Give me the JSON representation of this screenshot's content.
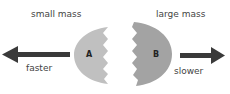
{
  "labels": {
    "small_mass": "small mass",
    "large_mass": "large mass",
    "faster": "faster",
    "slower": "slower",
    "piece_a": "A",
    "piece_b": "B"
  },
  "colors": {
    "piece_a": "#c0c0c0",
    "piece_b": "#a3a3a3",
    "arrow": "#3a3a3a",
    "text": "#444444"
  }
}
